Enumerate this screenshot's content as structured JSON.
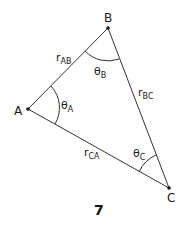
{
  "diagram": {
    "type": "triangle",
    "vertices": {
      "A": {
        "label": "A",
        "x": 28,
        "y": 109
      },
      "B": {
        "label": "B",
        "x": 108,
        "y": 28
      },
      "C": {
        "label": "C",
        "x": 169,
        "y": 188
      }
    },
    "sides": {
      "AB": {
        "symbol": "r",
        "subscript": "AB"
      },
      "BC": {
        "symbol": "r",
        "subscript": "BC"
      },
      "CA": {
        "symbol": "r",
        "subscript": "CA"
      }
    },
    "angles": {
      "A": {
        "symbol": "θ",
        "subscript": "A"
      },
      "B": {
        "symbol": "θ",
        "subscript": "B"
      },
      "C": {
        "symbol": "θ",
        "subscript": "C"
      }
    },
    "caption": "7",
    "line_color": "#333333"
  }
}
